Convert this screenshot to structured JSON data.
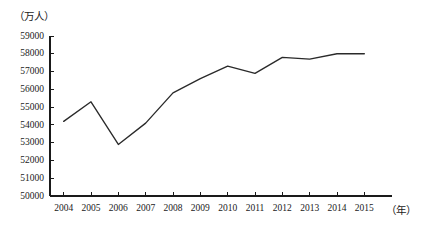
{
  "chart_data": {
    "type": "line",
    "title": "",
    "xlabel": "（年）",
    "ylabel": "（万人）",
    "categories": [
      "2004",
      "2005",
      "2006",
      "2007",
      "2008",
      "2009",
      "2010",
      "2011",
      "2012",
      "2013",
      "2014",
      "2015"
    ],
    "series": [
      {
        "name": "",
        "values": [
          54200,
          55300,
          52900,
          54100,
          55800,
          56600,
          57300,
          56900,
          57800,
          57700,
          58000,
          58000
        ]
      }
    ],
    "ylim": [
      50000,
      59000
    ],
    "ytick_step": 1000,
    "yticks": [
      "59000",
      "58000",
      "57000",
      "56000",
      "55000",
      "54000",
      "53000",
      "52000",
      "51000",
      "50000"
    ],
    "ytick_values": [
      59000,
      58000,
      57000,
      56000,
      55000,
      54000,
      53000,
      52000,
      51000,
      50000
    ],
    "grid": false,
    "legend": "none",
    "line_color": "#2a2a2a",
    "axis_color": "#1a1a1a"
  },
  "axes": {
    "y_unit_label": "（万人）",
    "x_unit_label": "（年）"
  }
}
